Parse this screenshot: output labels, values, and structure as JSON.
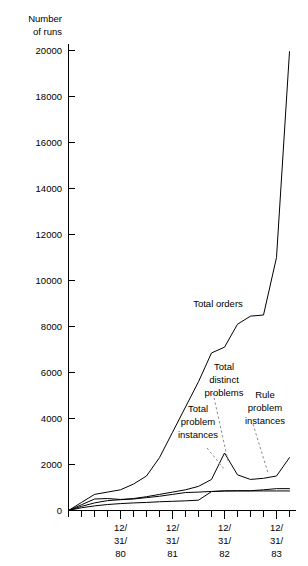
{
  "chart_data": {
    "type": "line",
    "title": "",
    "xlabel": "",
    "ylabel": "Number of runs",
    "ylabel_line1": "Number",
    "ylabel_line2": "of runs",
    "ylim": [
      0,
      20000
    ],
    "ytick_values": [
      0,
      2000,
      4000,
      6000,
      8000,
      10000,
      12000,
      14000,
      16000,
      18000,
      20000
    ],
    "ytick_labels": [
      "0",
      "2000",
      "4000",
      "6000",
      "8000",
      "10000",
      "12000",
      "14000",
      "16000",
      "18000",
      "20000"
    ],
    "grid": false,
    "legend_position": "inline-annotations",
    "x_axis_kind": "date-quarterly",
    "xtick_labels": [
      {
        "line1": "12/",
        "line2": "31/",
        "line3": "80",
        "x": 4
      },
      {
        "line1": "12/",
        "line2": "31/",
        "line3": "81",
        "x": 8
      },
      {
        "line1": "12/",
        "line2": "31/",
        "line3": "82",
        "x": 12
      },
      {
        "line1": "12/",
        "line2": "31/",
        "line3": "83",
        "x": 16
      }
    ],
    "x_minor_count": 18,
    "x": [
      0,
      1,
      2,
      3,
      4,
      5,
      6,
      7,
      8,
      9,
      10,
      11,
      12,
      13,
      14,
      15,
      16,
      17
    ],
    "series": [
      {
        "name": "Total orders",
        "values": [
          0,
          350,
          700,
          800,
          900,
          1150,
          1500,
          2300,
          3400,
          4500,
          5600,
          6850,
          7100,
          8100,
          8450,
          8500,
          11000,
          19950
        ]
      },
      {
        "name": "Total problem instances",
        "values": [
          0,
          250,
          500,
          520,
          480,
          520,
          600,
          700,
          800,
          900,
          1050,
          1350,
          2500,
          1550,
          1350,
          1400,
          1500,
          2300
        ]
      },
      {
        "name": "Total distinct problems",
        "values": [
          0,
          180,
          330,
          430,
          470,
          500,
          560,
          620,
          700,
          780,
          800,
          830,
          850,
          860,
          860,
          900,
          950,
          950
        ]
      },
      {
        "name": "Rule problem instances",
        "values": [
          0,
          120,
          200,
          260,
          300,
          330,
          350,
          380,
          400,
          420,
          450,
          820,
          850,
          850,
          850,
          850,
          850,
          850
        ]
      }
    ],
    "annotations": [
      {
        "name": "Total orders",
        "text_lines": [
          "Total orders"
        ],
        "has_leader": false
      },
      {
        "name": "Total distinct problems",
        "text_lines": [
          "Total",
          "distinct",
          "problems"
        ],
        "has_leader": true
      },
      {
        "name": "Total problem instances",
        "text_lines": [
          "Total",
          "problem",
          "instances"
        ],
        "has_leader": true
      },
      {
        "name": "Rule problem instances",
        "text_lines": [
          "Rule",
          "problem",
          "instances"
        ],
        "has_leader": true
      }
    ],
    "colors": {
      "line": "#000000",
      "axis": "#000000",
      "leader": "#8a8a8a",
      "background": "#ffffff"
    }
  }
}
